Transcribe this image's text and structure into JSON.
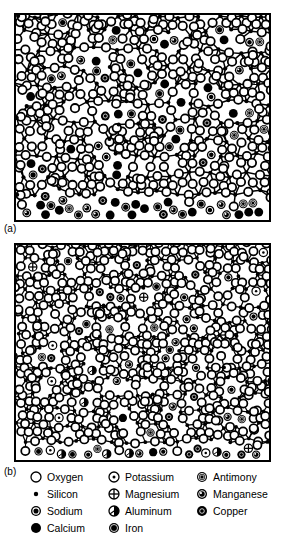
{
  "figure": {
    "type": "scientific-diagram",
    "panels": [
      {
        "id": "a",
        "label": "(a)",
        "caption_label": "(a)",
        "structure": "silicate random network with network-modifier cations",
        "network_vertex_species": "Silicon",
        "network_corner_species": "Oxygen"
      },
      {
        "id": "b",
        "label": "(b)",
        "caption_label": "(b)",
        "structure": "silicate random network with multiple network-modifier cation species",
        "network_vertex_species": "Silicon",
        "network_corner_species": "Oxygen"
      }
    ]
  },
  "legend": {
    "columns": [
      {
        "items": [
          {
            "symbol": "open-circle",
            "label": "Oxygen"
          },
          {
            "symbol": "small-filled-dot",
            "label": "Silicon"
          },
          {
            "symbol": "filled-circle-ring-dot",
            "label": "Sodium"
          },
          {
            "symbol": "solid-filled-circle",
            "label": "Calcium"
          }
        ]
      },
      {
        "items": [
          {
            "symbol": "circle-center-dot",
            "label": "Potassium"
          },
          {
            "symbol": "circle-cross",
            "label": "Magnesium"
          },
          {
            "symbol": "circle-diagonal-wedge",
            "label": "Aluminum"
          },
          {
            "symbol": "filled-circle-thin-ring",
            "label": "Iron"
          }
        ]
      },
      {
        "items": [
          {
            "symbol": "filled-circle-double-ring",
            "label": "Antimony"
          },
          {
            "symbol": "filled-circle-offset-dot",
            "label": "Manganese"
          },
          {
            "symbol": "filled-circle-small-ring",
            "label": "Copper"
          }
        ]
      }
    ]
  },
  "colors": {
    "ink": "#000000",
    "paper": "#ffffff",
    "frame": "#000000"
  }
}
